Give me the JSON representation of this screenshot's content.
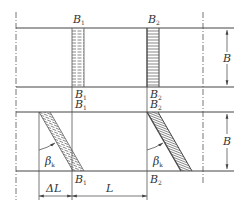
{
  "diagram": {
    "top_panel": {
      "labels_top": [
        {
          "main": "B",
          "sub": "1"
        },
        {
          "main": "B",
          "sub": "2"
        }
      ],
      "labels_bottom": [
        {
          "main": "B",
          "sub": "1"
        },
        {
          "main": "B",
          "sub": "2"
        }
      ],
      "width_label": "B"
    },
    "bottom_panel": {
      "labels_top": [
        {
          "main": "B",
          "sub": "1"
        },
        {
          "main": "B",
          "sub": "2"
        }
      ],
      "labels_bottom": [
        {
          "main": "B",
          "sub": "1"
        },
        {
          "main": "B",
          "sub": "2"
        }
      ],
      "angle_left": {
        "main": "β",
        "sub": "k"
      },
      "angle_right": {
        "main": "β",
        "sub": "k"
      },
      "width_label": "B",
      "offset_label": "ΔL",
      "length_label": "L"
    }
  }
}
